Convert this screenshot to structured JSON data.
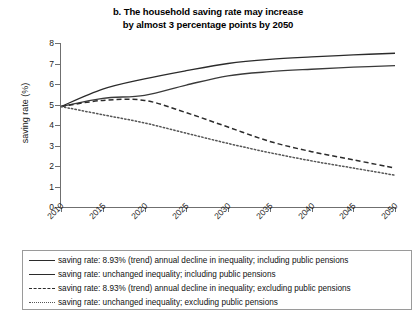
{
  "title": {
    "line1": "b. The household saving rate may increase",
    "line2": "by almost 3 percentage points by 2050"
  },
  "axis": {
    "ylabel": "saving rate (%)",
    "yticks": [
      "8",
      "7",
      "6",
      "5",
      "4",
      "3",
      "2",
      "1",
      "0"
    ],
    "xticks": [
      "2010",
      "2015",
      "2020",
      "2025",
      "2030",
      "2035",
      "2040",
      "2045",
      "2050"
    ]
  },
  "legend": {
    "items": [
      {
        "style": "solid",
        "label": "saving rate: 8.93% (trend) annual decline in inequality; including public pensions"
      },
      {
        "style": "solid",
        "label": "saving rate: unchanged inequality; including public pensions"
      },
      {
        "style": "dashed",
        "label": "saving rate: 8.93% (trend) annual decline in inequality; excluding public pensions"
      },
      {
        "style": "dotted",
        "label": "saving rate: unchanged inequality; excluding public pensions"
      }
    ]
  },
  "chart_data": {
    "type": "line",
    "title": "b. The household saving rate may increase by almost 3 percentage points by 2050",
    "xlabel": "",
    "ylabel": "saving rate (%)",
    "x": [
      2010,
      2015,
      2020,
      2025,
      2030,
      2035,
      2040,
      2045,
      2050
    ],
    "xlim": [
      2010,
      2050
    ],
    "ylim": [
      0,
      8
    ],
    "grid": false,
    "legend_position": "below",
    "series": [
      {
        "name": "saving rate: 8.93% (trend) annual decline in inequality; including public pensions",
        "style": "solid",
        "color": "#2b2b2b",
        "values": [
          4.9,
          5.75,
          6.25,
          6.65,
          7.0,
          7.2,
          7.32,
          7.42,
          7.5
        ]
      },
      {
        "name": "saving rate: unchanged inequality; including public pensions",
        "style": "solid",
        "color": "#3a3a3a",
        "values": [
          4.9,
          5.3,
          5.45,
          5.95,
          6.4,
          6.6,
          6.72,
          6.82,
          6.9
        ]
      },
      {
        "name": "saving rate: 8.93% (trend) annual decline in inequality; excluding public pensions",
        "style": "dashed",
        "color": "#2b2b2b",
        "values": [
          4.9,
          5.2,
          5.2,
          4.6,
          3.9,
          3.2,
          2.7,
          2.3,
          1.9
        ]
      },
      {
        "name": "saving rate: unchanged inequality; excluding public pensions",
        "style": "dotted",
        "color": "#555555",
        "values": [
          4.9,
          4.5,
          4.1,
          3.6,
          3.1,
          2.65,
          2.25,
          1.9,
          1.55
        ]
      }
    ]
  }
}
